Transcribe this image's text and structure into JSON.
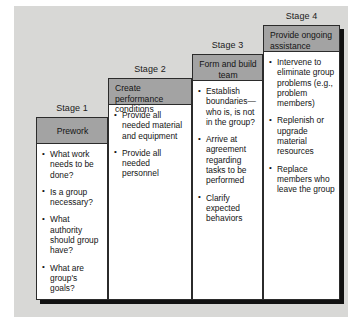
{
  "figure": {
    "panel_color": "#d8d8d6",
    "header_color": "#a3a3a3",
    "border_color": "#2b2b2b",
    "shadow_color": "#111111"
  },
  "stages": [
    {
      "label": "Stage 1",
      "header": "Prework",
      "header_align": "centered",
      "bullets": [
        "What work needs to be done?",
        "Is a group necessary?",
        "What authority should group have?",
        "What are group's goals?"
      ]
    },
    {
      "label": "Stage 2",
      "header": "Create performance conditions",
      "header_align": "left",
      "bullets": [
        "Provide all needed material and equipment",
        "Provide all needed personnel"
      ]
    },
    {
      "label": "Stage 3",
      "header": "Form and build team",
      "header_align": "centered",
      "bullets": [
        "Establish boundaries—who is, is not in the group?",
        "Arrive at agreement regarding tasks to be performed",
        "Clarify expected behaviors"
      ]
    },
    {
      "label": "Stage 4",
      "header": "Provide ongoing assistance",
      "header_align": "left",
      "bullets": [
        "Intervene to eliminate group problems (e.g., problem members)",
        "Replenish or upgrade material resources",
        "Replace members who leave the group"
      ]
    }
  ]
}
